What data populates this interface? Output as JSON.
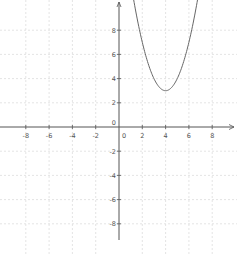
{
  "chart_data": {
    "type": "line",
    "title": "",
    "xlabel": "",
    "ylabel": "",
    "function": "y = (x - 4)^2 + 3",
    "xlim": [
      -10.2,
      10.2
    ],
    "ylim": [
      -11,
      10.9
    ],
    "grid": true,
    "x_ticks": [
      -8,
      -6,
      -4,
      -2,
      0,
      2,
      4,
      6,
      8
    ],
    "y_ticks": [
      -8,
      -6,
      -4,
      -2,
      0,
      2,
      4,
      6,
      8
    ],
    "x_tick_labels": [
      "-8",
      "-6",
      "-4",
      "-2",
      "0",
      "2",
      "4",
      "6",
      "8"
    ],
    "y_tick_labels": [
      "-8",
      "-6",
      "-4",
      "-2",
      "0",
      "2",
      "4",
      "6",
      "8"
    ],
    "series": [
      {
        "name": "parabola",
        "vertex": [
          4,
          3
        ],
        "x": [
          1.2,
          1.5,
          2,
          2.5,
          3,
          3.5,
          4,
          4.5,
          5,
          5.5,
          6,
          6.5,
          6.8
        ],
        "y": [
          10.84,
          9.25,
          7,
          5.25,
          4,
          3.25,
          3,
          3.25,
          4,
          5.25,
          7,
          9.25,
          10.84
        ]
      }
    ]
  },
  "colors": {
    "axis": "#555555",
    "grid": "#d9d9d9",
    "curve": "#666666",
    "background": "#ffffff"
  }
}
